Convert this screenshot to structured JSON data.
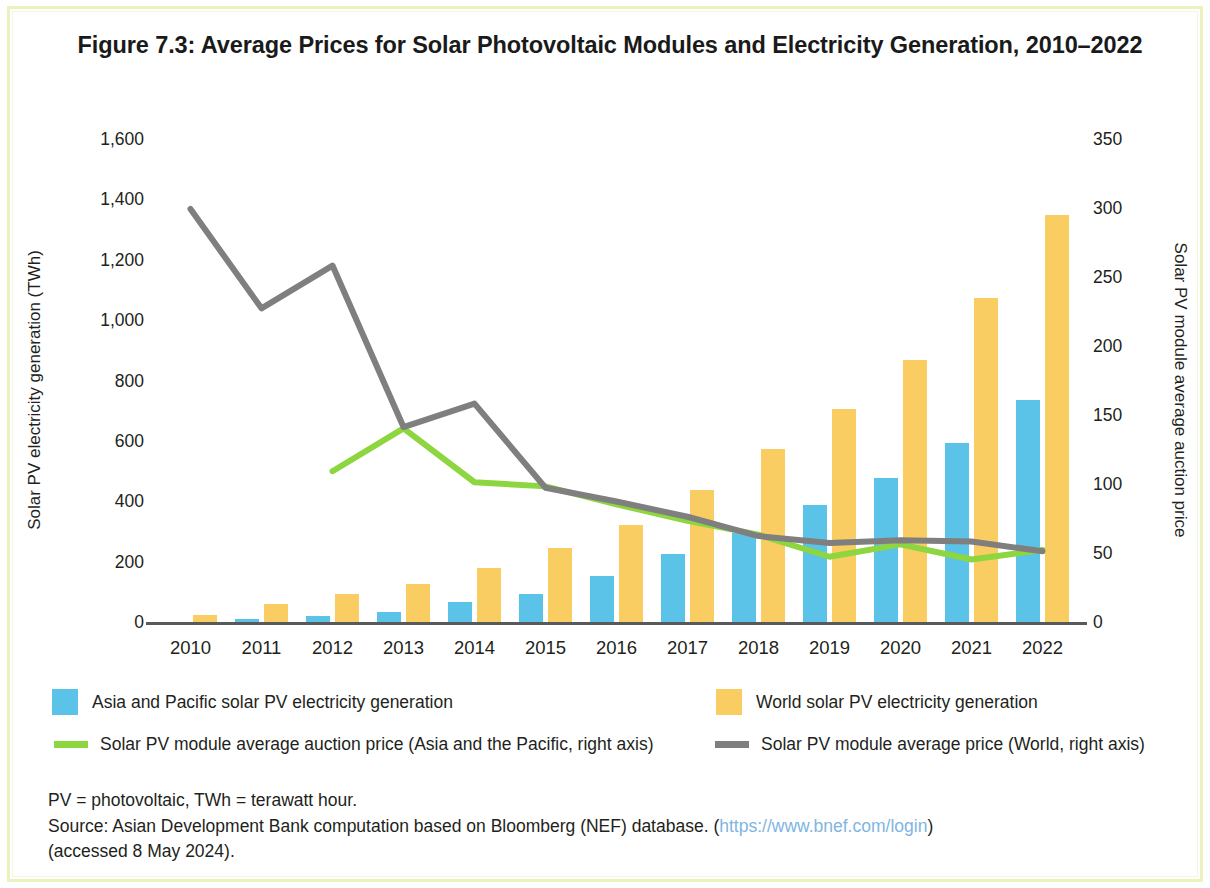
{
  "figure": {
    "title": "Figure 7.3: Average Prices for Solar Photovoltaic Modules and Electricity Generation, 2010–2022"
  },
  "legend": {
    "items": [
      {
        "label": "Asia and Pacific solar PV electricity generation",
        "marker": "square",
        "color": "#5BC3E7"
      },
      {
        "label": "World solar PV electricity generation",
        "marker": "square",
        "color": "#F9CD61"
      },
      {
        "label": "Solar PV module average auction price (Asia and the Pacific, right axis)",
        "marker": "line",
        "color": "#8DD63F"
      },
      {
        "label": "Solar PV module average price (World, right axis)",
        "marker": "line",
        "color": "#7F7F7F"
      }
    ]
  },
  "footnotes": {
    "line1": "PV = photovoltaic, TWh = terawatt hour.",
    "line2_prefix": "Source: Asian Development Bank computation based on Bloomberg (NEF) database. (",
    "line2_url": "https://www.bnef.com/login",
    "line2_suffix": ")",
    "line3": "(accessed 8 May 2024)."
  },
  "chart_data": {
    "type": "bar",
    "title": "Figure 7.3: Average Prices for Solar Photovoltaic Modules and Electricity Generation, 2010–2022",
    "categories": [
      "2010",
      "2011",
      "2012",
      "2013",
      "2014",
      "2015",
      "2016",
      "2017",
      "2018",
      "2019",
      "2020",
      "2021",
      "2022"
    ],
    "xlabel": "",
    "ylabel": "Solar PV electricity generation (TWh)",
    "ylabel_right": "Solar PV module average auction price",
    "ylim": [
      0,
      1600
    ],
    "ylim_right": [
      0,
      350
    ],
    "yticks": [
      "0",
      "200",
      "400",
      "600",
      "800",
      "1,000",
      "1,200",
      "1,400",
      "1,600"
    ],
    "yticks_right": [
      "0",
      "50",
      "100",
      "150",
      "200",
      "250",
      "300",
      "350"
    ],
    "grid": false,
    "legend_position": "bottom",
    "series": [
      {
        "name": "Asia and Pacific solar PV electricity generation",
        "type": "bar",
        "axis": "left",
        "color": "#5BC3E7",
        "values": [
          4,
          12,
          22,
          36,
          68,
          95,
          155,
          228,
          298,
          392,
          481,
          595,
          740
        ]
      },
      {
        "name": "World solar PV electricity generation",
        "type": "bar",
        "axis": "left",
        "color": "#F9CD61",
        "values": [
          28,
          62,
          95,
          130,
          182,
          248,
          325,
          442,
          575,
          710,
          870,
          1075,
          1350
        ]
      },
      {
        "name": "Solar PV module average auction price (Asia and the Pacific, right axis)",
        "type": "line",
        "axis": "right",
        "color": "#8DD63F",
        "values": [
          null,
          null,
          110,
          141,
          102,
          99,
          86,
          74,
          64,
          48,
          57,
          46,
          53
        ]
      },
      {
        "name": "Solar PV module average price (World, right axis)",
        "type": "line",
        "axis": "right",
        "color": "#7F7F7F",
        "values": [
          300,
          228,
          259,
          142,
          159,
          98,
          88,
          77,
          63,
          58,
          60,
          59,
          52
        ]
      }
    ]
  }
}
